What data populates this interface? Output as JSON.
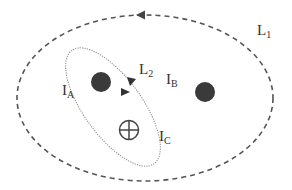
{
  "diagram": {
    "type": "ampere-loop-currents",
    "loops": [
      {
        "id": "L1",
        "label": "L",
        "subscript": "1",
        "style": "dashed",
        "direction": "counter-clockwise"
      },
      {
        "id": "L2",
        "label": "L",
        "subscript": "2",
        "style": "dotted",
        "direction": "clockwise"
      }
    ],
    "currents": [
      {
        "id": "IA",
        "label": "I",
        "subscript": "A",
        "symbol": "filled-dot"
      },
      {
        "id": "IB",
        "label": "I",
        "subscript": "B",
        "symbol": "filled-dot"
      },
      {
        "id": "IC",
        "label": "I",
        "subscript": "C",
        "symbol": "circle-plus"
      }
    ]
  },
  "colors": {
    "line": "#555555",
    "dot": "#3a3a3a",
    "text": "#333333"
  }
}
